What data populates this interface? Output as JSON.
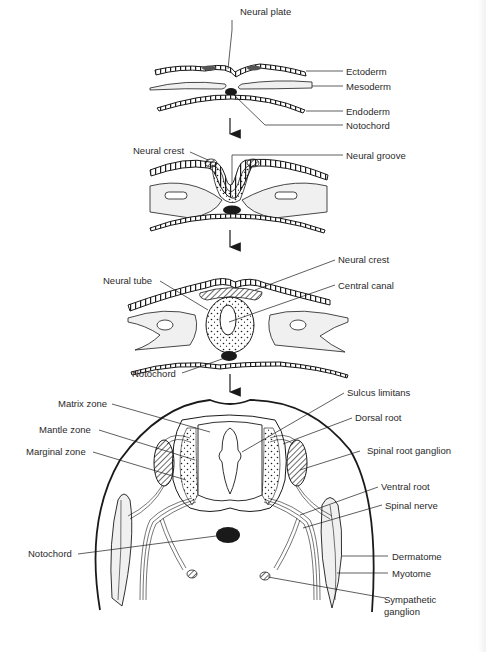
{
  "figure": {
    "stages": [
      {
        "id": "stage-1-neural-plate",
        "labels": {
          "neural_plate": "Neural plate",
          "ectoderm": "Ectoderm",
          "mesoderm": "Mesoderm",
          "endoderm": "Endoderm",
          "notochord": "Notochord"
        }
      },
      {
        "id": "stage-2-neural-groove",
        "labels": {
          "neural_crest": "Neural crest",
          "neural_groove": "Neural groove"
        }
      },
      {
        "id": "stage-3-neural-tube",
        "labels": {
          "neural_tube": "Neural tube",
          "neural_crest": "Neural crest",
          "central_canal": "Central canal",
          "notochord": "Notochord"
        }
      },
      {
        "id": "stage-4-spinal-cord",
        "labels": {
          "matrix_zone": "Matrix zone",
          "mantle_zone": "Mantle zone",
          "marginal_zone": "Marginal zone",
          "notochord": "Notochord",
          "sulcus_limitans": "Sulcus limitans",
          "dorsal_root": "Dorsal root",
          "spinal_root_ganglion": "Spinal root ganglion",
          "ventral_root": "Ventral root",
          "spinal_nerve": "Spinal nerve",
          "dermatome": "Dermatome",
          "myotome": "Myotome",
          "sympathetic_ganglion_line1": "Sympathetic",
          "sympathetic_ganglion_line2": "ganglion"
        }
      }
    ],
    "colors": {
      "ink": "#1a1a1a",
      "fill_light": "#f0f0f0",
      "text": "#2a2a2a"
    }
  }
}
